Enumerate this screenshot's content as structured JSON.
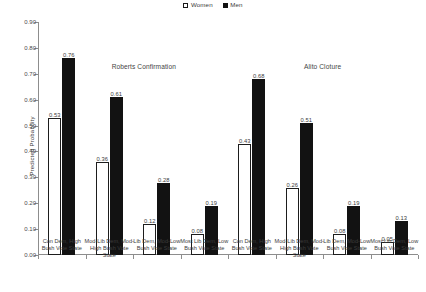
{
  "legend": {
    "entries": [
      {
        "label": "Women",
        "style": "open",
        "color": "#ffffff"
      },
      {
        "label": "Men",
        "style": "filled",
        "color": "#121212"
      }
    ]
  },
  "axes": {
    "y_title": "Predicted Probability",
    "y_ticks": [
      "0.00",
      "0.10",
      "0.20",
      "0.30",
      "0.40",
      "0.50",
      "0.60",
      "0.70",
      "0.80",
      "0.90"
    ]
  },
  "panels": [
    {
      "title": "Roberts Confirmation"
    },
    {
      "title": "Alito Cloture"
    }
  ],
  "categories": [
    "Con Dem, High Bush Vote State",
    "Mod-Lib Dem, Mod-High Bush Vote State",
    "Lib Dem, Mod-Low Bush Vote State",
    "Most Lib Dem, Low Bush Vote State"
  ],
  "bar_labels": {
    "roberts_women": [
      "0.53",
      "0.36",
      "0.12",
      "0.08"
    ],
    "roberts_men": [
      "0.76",
      "0.61",
      "0.28",
      "0.19"
    ],
    "alito_women": [
      "0.43",
      "0.26",
      "0.08",
      "0.05"
    ],
    "alito_men": [
      "0.68",
      "0.51",
      "0.19",
      "0.13"
    ]
  },
  "chart_data": {
    "type": "bar",
    "title": "",
    "xlabel": "",
    "ylabel": "Predicted Probability",
    "ylim": [
      0.0,
      0.9
    ],
    "ytick_step": 0.1,
    "grid": false,
    "legend_position": "top-center",
    "panels": [
      {
        "title": "Roberts Confirmation",
        "categories": [
          "Con Dem, High Bush Vote State",
          "Mod-Lib Dem, Mod-High Bush Vote State",
          "Lib Dem, Mod-Low Bush Vote State",
          "Most Lib Dem, Low Bush Vote State"
        ],
        "series": [
          {
            "name": "Women",
            "values": [
              0.53,
              0.36,
              0.12,
              0.08
            ]
          },
          {
            "name": "Men",
            "values": [
              0.76,
              0.61,
              0.28,
              0.19
            ]
          }
        ]
      },
      {
        "title": "Alito Cloture",
        "categories": [
          "Con Dem, High Bush Vote State",
          "Mod-Lib Dem, Mod-High Bush Vote State",
          "Lib Dem, Mod-Low Bush Vote State",
          "Most Lib Dem, Low Bush Vote State"
        ],
        "series": [
          {
            "name": "Women",
            "values": [
              0.43,
              0.26,
              0.08,
              0.05
            ]
          },
          {
            "name": "Men",
            "values": [
              0.68,
              0.51,
              0.19,
              0.13
            ]
          }
        ]
      }
    ]
  }
}
